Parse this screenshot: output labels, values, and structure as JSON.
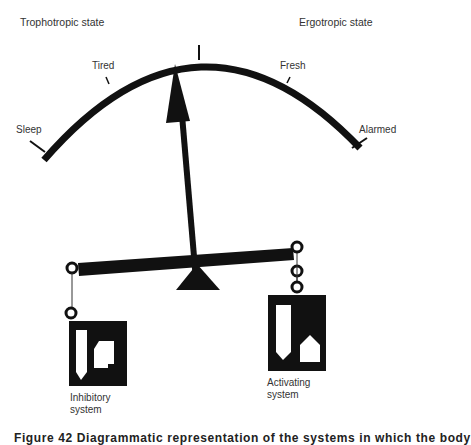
{
  "states": {
    "left": "Trophotropic state",
    "right": "Ergotropic state"
  },
  "gauge": {
    "scale_labels": [
      "Sleep",
      "Tired",
      "Fresh",
      "Alarmed"
    ]
  },
  "systems": {
    "left": {
      "line1": "Inhibitory",
      "line2": "system"
    },
    "right": {
      "line1": "Activating",
      "line2": "system"
    }
  },
  "caption": "Figure 42   Diagrammatic representation of the systems in which the body"
}
